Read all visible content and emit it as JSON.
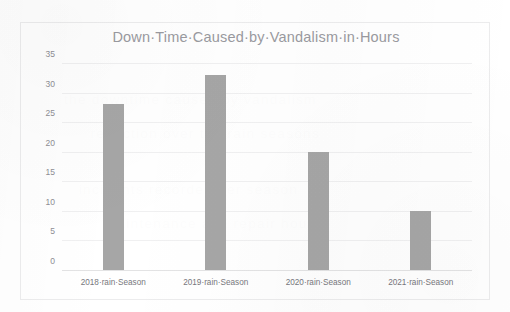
{
  "page": {
    "cut_off_top_line": "g       e  ti      y   s  p       g  p"
  },
  "chart": {
    "title": "Down·Time·Caused·by·Vandalism·in·Hours",
    "bar_color": "#a6a6a6",
    "gridline_color": "#f0f0f1",
    "axis_color": "#e3e3e4",
    "border_color": "#ececed",
    "tick_label_color": "#8e8e94"
  },
  "ghost_text": [
    {
      "text": "the downtime caused by vandalism",
      "left": 70,
      "top": 92
    },
    {
      "text": "reduction over the rain seasons",
      "left": 96,
      "top": 126
    },
    {
      "text": "incidents recorded per season",
      "left": 84,
      "top": 182
    },
    {
      "text": "maintenance and repair hours",
      "left": 110,
      "top": 216
    }
  ],
  "chart_data": {
    "type": "bar",
    "title": "Down·Time·Caused·by·Vandalism·in·Hours",
    "xlabel": "",
    "ylabel": "",
    "categories": [
      "2018·rain·Season",
      "2019·rain·Season",
      "2020·rain·Season",
      "2021·rain·Season"
    ],
    "values": [
      28,
      33,
      20,
      10
    ],
    "ylim": [
      0,
      35
    ],
    "yticks": [
      0,
      5,
      10,
      15,
      20,
      25,
      30,
      35
    ],
    "ytick_labels": [
      "0",
      "5",
      "10",
      "15",
      "20",
      "25",
      "30",
      "35"
    ],
    "grid": true,
    "grid_axis": "y",
    "legend": false,
    "legend_position": "none"
  }
}
